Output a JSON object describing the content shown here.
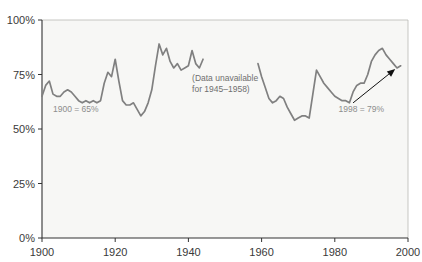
{
  "chart_data": {
    "type": "line",
    "title": "",
    "xlabel": "",
    "ylabel": "",
    "xlim": [
      1900,
      2000
    ],
    "ylim": [
      0,
      100
    ],
    "grid": false,
    "legend": "none",
    "y_ticks": [
      "0%",
      "25%",
      "50%",
      "75%",
      "100%"
    ],
    "y_tick_values": [
      0,
      25,
      50,
      75,
      100
    ],
    "x_ticks": [
      "1900",
      "1920",
      "1940",
      "1960",
      "1980",
      "2000"
    ],
    "x_tick_values": [
      1900,
      1920,
      1940,
      1960,
      1980,
      2000
    ],
    "line_color": "#808080",
    "plot_background": "#f7f7f5",
    "axis_color": "#333333",
    "annotations": [
      {
        "name": "start-value",
        "text": "1900 = 65%",
        "x": 1903,
        "y": 58
      },
      {
        "name": "gap-note-line1",
        "text": "(Data unavailable",
        "x": 1941,
        "y": 72
      },
      {
        "name": "gap-note-line2",
        "text": "for  1945–1958)",
        "x": 1941,
        "y": 67
      },
      {
        "name": "end-value",
        "text": "1998 = 79%",
        "x": 1981,
        "y": 58
      }
    ],
    "series": [
      {
        "name": "1900-1944",
        "x": [
          1900,
          1901,
          1902,
          1903,
          1904,
          1905,
          1906,
          1907,
          1908,
          1909,
          1910,
          1911,
          1912,
          1913,
          1914,
          1915,
          1916,
          1917,
          1918,
          1919,
          1920,
          1921,
          1922,
          1923,
          1924,
          1925,
          1926,
          1927,
          1928,
          1929,
          1930,
          1931,
          1932,
          1933,
          1934,
          1935,
          1936,
          1937,
          1938,
          1939,
          1940,
          1941,
          1942,
          1943,
          1944
        ],
        "values": [
          65,
          70,
          72,
          66,
          65,
          65,
          67,
          68,
          67,
          65,
          63,
          62,
          63,
          62,
          63,
          62,
          63,
          71,
          76,
          74,
          82,
          72,
          63,
          61,
          61,
          62,
          59,
          56,
          58,
          62,
          68,
          79,
          89,
          84,
          87,
          81,
          78,
          80,
          77,
          78,
          79,
          86,
          80,
          78,
          82
        ]
      },
      {
        "name": "1959-1998",
        "x": [
          1959,
          1960,
          1961,
          1962,
          1963,
          1964,
          1965,
          1966,
          1967,
          1968,
          1969,
          1970,
          1971,
          1972,
          1973,
          1974,
          1975,
          1976,
          1977,
          1978,
          1979,
          1980,
          1981,
          1982,
          1983,
          1984,
          1985,
          1986,
          1987,
          1988,
          1989,
          1990,
          1991,
          1992,
          1993,
          1994,
          1995,
          1996,
          1997,
          1998
        ],
        "values": [
          80,
          74,
          69,
          64,
          62,
          63,
          65,
          64,
          60,
          57,
          54,
          55,
          56,
          56,
          55,
          66,
          77,
          74,
          71,
          69,
          67,
          65,
          64,
          63,
          63,
          62,
          67,
          70,
          71,
          71,
          75,
          81,
          84,
          86,
          87,
          84,
          82,
          80,
          78,
          79
        ]
      }
    ],
    "gap": {
      "start": 1945,
      "end": 1958
    }
  }
}
